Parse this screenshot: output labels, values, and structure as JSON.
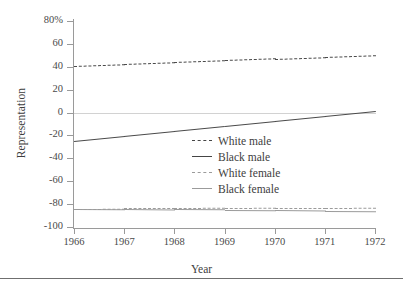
{
  "chart_data": {
    "type": "line",
    "title": "",
    "xlabel": "Year",
    "ylabel": "Representation",
    "x": [
      1966,
      1967,
      1968,
      1969,
      1970,
      1971,
      1972
    ],
    "xtick_labels": [
      "1966",
      "1967",
      "1968",
      "1969",
      "1970",
      "1971",
      "1972"
    ],
    "ytick_labels": [
      "80%",
      "60",
      "40",
      "20",
      "0",
      "-20",
      "-40",
      "-60",
      "-80",
      "-100"
    ],
    "ytick_values": [
      80,
      60,
      40,
      20,
      0,
      -20,
      -40,
      -60,
      -80,
      -100
    ],
    "ylim": [
      -100,
      80
    ],
    "xlim": [
      1966,
      1972
    ],
    "grid": false,
    "zero_reference_line": true,
    "legend_position": "center-right",
    "series": [
      {
        "name": "White male",
        "style": "dashed",
        "color": "#4a4a4a",
        "values": [
          41,
          42.5,
          44,
          45.5,
          47,
          48.5,
          50
        ]
      },
      {
        "name": "Black male",
        "style": "solid",
        "color": "#4a4a4a",
        "values": [
          -25,
          -20.7,
          -16.3,
          -12,
          -7.7,
          -3.3,
          1
        ]
      },
      {
        "name": "White female",
        "style": "dashed",
        "color": "#9b9b9b",
        "values": [
          -84,
          -83.8,
          -83.7,
          -83.5,
          -83.3,
          -83.2,
          -83
        ]
      },
      {
        "name": "Black female",
        "style": "solid",
        "color": "#9b9b9b",
        "values": [
          -84,
          -84.3,
          -84.7,
          -85,
          -85.3,
          -85.7,
          -86
        ]
      }
    ]
  },
  "legend": {
    "entries": [
      {
        "label": "White male"
      },
      {
        "label": "Black male"
      },
      {
        "label": "White female"
      },
      {
        "label": "Black female"
      }
    ]
  }
}
